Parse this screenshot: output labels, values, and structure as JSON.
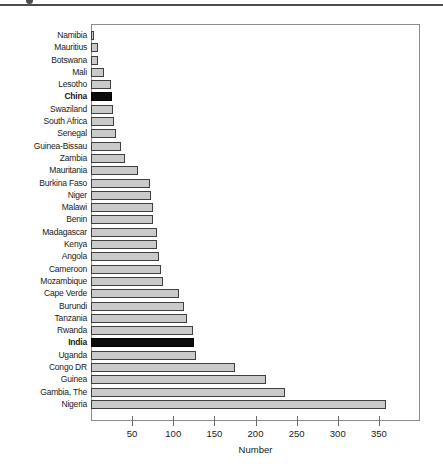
{
  "figure": {
    "note": "cropped-figure-caption-rule"
  },
  "chart_data": {
    "type": "bar",
    "orientation": "horizontal",
    "title": "",
    "xlabel": "Number",
    "ylabel": "",
    "xlim": [
      0,
      400
    ],
    "xticks": [
      50,
      100,
      150,
      200,
      250,
      300,
      350
    ],
    "grid": false,
    "legend": false,
    "categories": [
      "Namibia",
      "Mauritius",
      "Botswana",
      "Mali",
      "Lesotho",
      "China",
      "Swaziland",
      "South Africa",
      "Senegal",
      "Guinea-Bissau",
      "Zambia",
      "Mauritania",
      "Burkina Faso",
      "Niger",
      "Malawi",
      "Benin",
      "Madagascar",
      "Kenya",
      "Angola",
      "Cameroon",
      "Mozambique",
      "Cape Verde",
      "Burundi",
      "Tanzania",
      "Rwanda",
      "India",
      "Uganda",
      "Congo DR",
      "Guinea",
      "Gambia, The",
      "Nigeria"
    ],
    "values": [
      4,
      8,
      9,
      16,
      24,
      26,
      27,
      28,
      30,
      36,
      42,
      57,
      72,
      73,
      75,
      76,
      80,
      81,
      83,
      85,
      88,
      107,
      114,
      117,
      124,
      126,
      128,
      175,
      214,
      236,
      360
    ],
    "highlighted": [
      "China",
      "India"
    ],
    "colors": {
      "bar_fill": "#cacaca",
      "bar_border": "#404040",
      "highlight_fill": "#0b0b0b",
      "highlight_border": "#000000",
      "plot_border": "#8c8c8c",
      "text": "#1a1a1a",
      "top_rule": "#4d4d4d"
    }
  }
}
